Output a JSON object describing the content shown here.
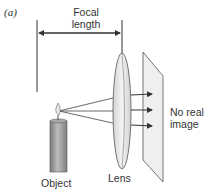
{
  "panel_label": "(a)",
  "labels": {
    "focal_length_line1": "Focal",
    "focal_length_line2": "length",
    "object": "Object",
    "lens": "Lens",
    "no_real_image_line1": "No real",
    "no_real_image_line2": "image"
  },
  "colors": {
    "line": "#333333",
    "lens_fill": "#e6e6e6",
    "screen_fill": "#efefef",
    "candle_fill": "#9a9a9a"
  }
}
